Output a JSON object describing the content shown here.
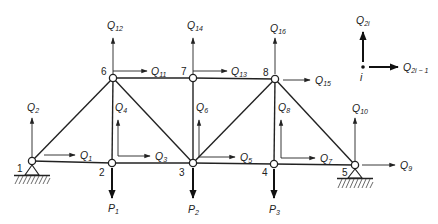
{
  "figure": {
    "type": "plane-truss-degrees-of-freedom",
    "joints": [
      {
        "id": "1",
        "label": "1",
        "x": 32,
        "y": 161,
        "support": "pin"
      },
      {
        "id": "2",
        "label": "2",
        "x": 112,
        "y": 163
      },
      {
        "id": "3",
        "label": "3",
        "x": 193,
        "y": 163
      },
      {
        "id": "4",
        "label": "4",
        "x": 274,
        "y": 164
      },
      {
        "id": "5",
        "label": "5",
        "x": 355,
        "y": 165,
        "support": "pin"
      },
      {
        "id": "6",
        "label": "6",
        "x": 113,
        "y": 78
      },
      {
        "id": "7",
        "label": "7",
        "x": 193,
        "y": 78
      },
      {
        "id": "8",
        "label": "8",
        "x": 275,
        "y": 79
      }
    ],
    "members": [
      [
        "1",
        "2"
      ],
      [
        "2",
        "3"
      ],
      [
        "3",
        "4"
      ],
      [
        "4",
        "5"
      ],
      [
        "6",
        "7"
      ],
      [
        "7",
        "8"
      ],
      [
        "1",
        "6"
      ],
      [
        "2",
        "6"
      ],
      [
        "6",
        "3"
      ],
      [
        "3",
        "7"
      ],
      [
        "3",
        "8"
      ],
      [
        "8",
        "4"
      ],
      [
        "8",
        "5"
      ]
    ],
    "dofs": [
      {
        "name": "Q",
        "sub": "1"
      },
      {
        "name": "Q",
        "sub": "2"
      },
      {
        "name": "Q",
        "sub": "3"
      },
      {
        "name": "Q",
        "sub": "4"
      },
      {
        "name": "Q",
        "sub": "5"
      },
      {
        "name": "Q",
        "sub": "6"
      },
      {
        "name": "Q",
        "sub": "7"
      },
      {
        "name": "Q",
        "sub": "8"
      },
      {
        "name": "Q",
        "sub": "9"
      },
      {
        "name": "Q",
        "sub": "10"
      },
      {
        "name": "Q",
        "sub": "11"
      },
      {
        "name": "Q",
        "sub": "12"
      },
      {
        "name": "Q",
        "sub": "13"
      },
      {
        "name": "Q",
        "sub": "14"
      },
      {
        "name": "Q",
        "sub": "15"
      },
      {
        "name": "Q",
        "sub": "16"
      }
    ],
    "loads": [
      {
        "name": "P",
        "sub": "1",
        "joint": "2"
      },
      {
        "name": "P",
        "sub": "2",
        "joint": "3"
      },
      {
        "name": "P",
        "sub": "3",
        "joint": "4"
      }
    ],
    "legend": {
      "node_label": "i",
      "vertical": {
        "name": "Q",
        "sub": "2i"
      },
      "horizontal": {
        "name": "Q",
        "sub": "2i − 1"
      }
    }
  }
}
